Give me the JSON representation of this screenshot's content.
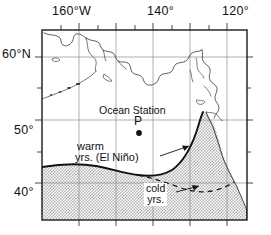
{
  "figure": {
    "kind": "map",
    "region": "Northeast Pacific Ocean / Gulf of Alaska",
    "background_color": "#ffffff",
    "frame_color": "#1a1a1a",
    "grid_color": "#8c8c8c",
    "coast_color": "#2b2b2b",
    "shade_color": "#c9c9c9"
  },
  "axes": {
    "top": {
      "ticks": [
        {
          "label": "160°W",
          "lon": -160
        },
        {
          "label": "140°",
          "lon": -140
        },
        {
          "label": "120°",
          "lon": -120
        }
      ],
      "minor_tick_interval_deg": 5
    },
    "left": {
      "ticks": [
        {
          "label": "60°N",
          "lat": 60
        },
        {
          "label": "50°",
          "lat": 50
        },
        {
          "label": "40°",
          "lat": 40
        }
      ],
      "minor_tick_interval_deg": 5
    },
    "lon_range": [
      -170,
      -115
    ],
    "lat_range": [
      33,
      63
    ],
    "gridline_interval_deg": 10
  },
  "annotations": {
    "ocean_station_title": "Ocean Station",
    "ocean_station_code": "P",
    "warm_line1": "warm",
    "warm_line2": "yrs.  (El Niño)",
    "cold_line1": "cold",
    "cold_line2": "yrs."
  },
  "markers": [
    {
      "name": "ocean-station-p",
      "label": "P",
      "lon": -145,
      "lat": 50
    }
  ],
  "boundaries": [
    {
      "name": "warm-years-boundary",
      "style": "solid",
      "label": "warm yrs. (El Niño)",
      "description": "Southern limit of warm subarctic water during El Niño years"
    },
    {
      "name": "cold-years-boundary",
      "style": "dashed",
      "label": "cold yrs.",
      "description": "Southern limit during cold years"
    }
  ],
  "shaded_region": {
    "name": "warm-water-domain",
    "pattern": "stipple",
    "description": "Stippled area south and east of the warm-years boundary"
  }
}
